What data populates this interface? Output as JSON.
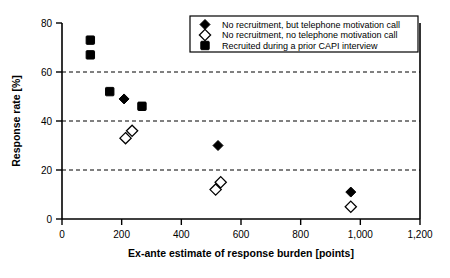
{
  "chart_data": {
    "type": "scatter",
    "title": "",
    "xlabel": "Ex-ante estimate of response burden [points]",
    "ylabel": "Response rate [%]",
    "xlim": [
      0,
      1200
    ],
    "ylim": [
      0,
      80
    ],
    "xticks": [
      0,
      200,
      400,
      600,
      800,
      1000,
      1200
    ],
    "xticklabels": [
      "0",
      "200",
      "400",
      "600",
      "800",
      "1,000",
      "1,200"
    ],
    "yticks": [
      0,
      20,
      40,
      60,
      80
    ],
    "yticklabels": [
      "0",
      "20",
      "40",
      "60",
      "80"
    ],
    "grid": "horizontal dashed gridlines at y = 20, 40, 60",
    "gridlines_y": [
      20,
      40,
      60
    ],
    "legend_position": "top-right inside plot area",
    "series": [
      {
        "name": "No recruitment, but telephone motivation call",
        "marker": "filled-diamond",
        "color": "#000000",
        "points": [
          {
            "x": 208,
            "y": 49
          },
          {
            "x": 523,
            "y": 30
          },
          {
            "x": 968,
            "y": 11
          }
        ]
      },
      {
        "name": "No recruitment, no telephone motivation call",
        "marker": "open-diamond",
        "color": "#ffffff",
        "points": [
          {
            "x": 213,
            "y": 33
          },
          {
            "x": 235,
            "y": 36
          },
          {
            "x": 515,
            "y": 12
          },
          {
            "x": 532,
            "y": 15
          },
          {
            "x": 968,
            "y": 5
          }
        ]
      },
      {
        "name": "Recruited during a prior CAPI interview",
        "marker": "filled-square",
        "color": "#000000",
        "points": [
          {
            "x": 95,
            "y": 73
          },
          {
            "x": 95,
            "y": 67
          },
          {
            "x": 160,
            "y": 52
          },
          {
            "x": 268,
            "y": 46
          }
        ]
      }
    ]
  },
  "legend": {
    "entries": [
      {
        "label": "No recruitment, but telephone motivation call",
        "marker": "filled-diamond"
      },
      {
        "label": "No recruitment, no telephone motivation call",
        "marker": "open-diamond"
      },
      {
        "label": "Recruited during a prior CAPI interview",
        "marker": "filled-square"
      }
    ]
  },
  "axes": {
    "x_title": "Ex-ante estimate of response burden [points]",
    "y_title": "Response rate [%]",
    "x_tick_labels": [
      "0",
      "200",
      "400",
      "600",
      "800",
      "1,000",
      "1,200"
    ],
    "y_tick_labels": [
      "0",
      "20",
      "40",
      "60",
      "80"
    ]
  },
  "colors": {
    "axis": "#000000",
    "grid": "#000000",
    "marker_fill": "#000000",
    "marker_open_fill": "#ffffff",
    "background": "#ffffff"
  }
}
